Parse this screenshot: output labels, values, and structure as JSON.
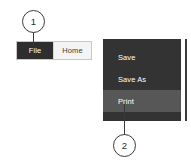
{
  "ribbon": {
    "tabs": [
      {
        "label": "File",
        "state": "selected"
      },
      {
        "label": "Home",
        "state": "normal"
      }
    ]
  },
  "menu": {
    "items": [
      {
        "label": "Save",
        "state": "normal"
      },
      {
        "label": "Save As",
        "state": "normal"
      },
      {
        "label": "Print",
        "state": "highlighted"
      }
    ]
  },
  "callouts": [
    {
      "number": "1",
      "target": "file-tab"
    },
    {
      "number": "2",
      "target": "print-menu-item"
    }
  ],
  "colors": {
    "panel_background": "#333333",
    "highlight_background": "#575757",
    "selected_tab_background": "#2e2e2e",
    "tab_background": "#f4f4f4",
    "menu_text": "#ffffff",
    "callout_stroke": "#3a3a3a",
    "page_background": "#ffffff"
  }
}
